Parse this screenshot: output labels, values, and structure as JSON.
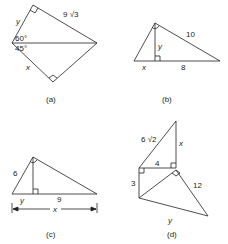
{
  "figure": {
    "panels": [
      {
        "id": "a",
        "caption": "(a)",
        "labels": {
          "y": "y",
          "hyp_top": "9 √3",
          "angle_top": "60°",
          "angle_bottom": "45°",
          "x": "x"
        }
      },
      {
        "id": "b",
        "caption": "(b)",
        "labels": {
          "hyp": "10",
          "y": "y",
          "x": "x",
          "base": "8"
        }
      },
      {
        "id": "c",
        "caption": "(c)",
        "labels": {
          "leg": "6",
          "y": "y",
          "base": "9",
          "x": "x"
        }
      },
      {
        "id": "d",
        "caption": "(d)",
        "labels": {
          "hyp_top": "6 √2",
          "x": "x",
          "mid": "4",
          "left": "3",
          "right": "12",
          "y": "y"
        }
      }
    ]
  }
}
